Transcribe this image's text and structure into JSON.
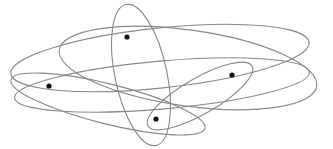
{
  "diagram": {
    "type": "hypergraph",
    "background": "#ffffff",
    "edge_color": "#888888",
    "node_color": "#111111",
    "nodes": [
      {
        "id": "n1",
        "x": 127,
        "y": 37
      },
      {
        "id": "n2",
        "x": 49,
        "y": 86
      },
      {
        "id": "n3",
        "x": 232,
        "y": 75
      },
      {
        "id": "n4",
        "x": 156,
        "y": 119
      }
    ],
    "hyperedges": [
      {
        "id": "e1",
        "members": [
          "n1",
          "n3"
        ],
        "cx": 188,
        "cy": 68,
        "rx": 130,
        "ry": 38,
        "rot": 8
      },
      {
        "id": "e2",
        "members": [
          "n2",
          "n3"
        ],
        "cx": 162,
        "cy": 85,
        "rx": 148,
        "ry": 24,
        "rot": -5
      },
      {
        "id": "e3",
        "members": [
          "n2",
          "n4"
        ],
        "cx": 108,
        "cy": 104,
        "rx": 100,
        "ry": 20,
        "rot": 14
      },
      {
        "id": "e4",
        "members": [
          "n1",
          "n4"
        ],
        "cx": 141,
        "cy": 75,
        "rx": 26,
        "ry": 72,
        "rot": -12
      },
      {
        "id": "e5",
        "members": [
          "n1",
          "n2",
          "n3"
        ],
        "cx": 160,
        "cy": 58,
        "rx": 150,
        "ry": 30,
        "rot": -6
      },
      {
        "id": "e6",
        "members": [
          "n3",
          "n4"
        ],
        "cx": 200,
        "cy": 96,
        "rx": 60,
        "ry": 18,
        "rot": -30
      }
    ]
  }
}
